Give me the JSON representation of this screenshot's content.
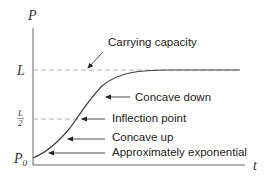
{
  "diagram": {
    "type": "logistic-growth-curve",
    "axes": {
      "y_label": "P",
      "x_label": "t"
    },
    "y_ticks": {
      "carrying_capacity": "L",
      "half_numerator": "L",
      "half_denominator": "2",
      "initial_base": "P",
      "initial_sub": "0"
    },
    "annotations": {
      "carrying_capacity": "Carrying capacity",
      "concave_down": "Concave down",
      "inflection_point": "Inflection point",
      "concave_up": "Concave up",
      "approx_exponential": "Approximately exponential"
    },
    "colors": {
      "curve": "#333333",
      "dashed": "#888888",
      "axis": "#555555",
      "text": "#222222"
    }
  }
}
